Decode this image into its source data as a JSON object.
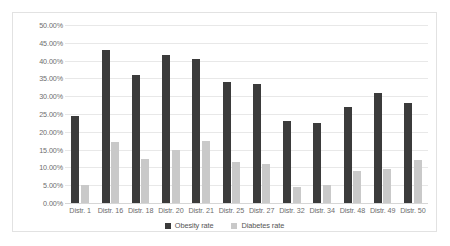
{
  "chart_data": {
    "type": "bar",
    "title": "",
    "xlabel": "",
    "ylabel": "",
    "ylim": [
      0,
      50
    ],
    "ytick_step": 5,
    "ytick_labels": [
      "0.00%",
      "5.00%",
      "10.00%",
      "15.00%",
      "20.00%",
      "25.00%",
      "30.00%",
      "35.00%",
      "40.00%",
      "45.00%",
      "50.00%"
    ],
    "grid": true,
    "legend_position": "bottom",
    "categories": [
      "Distr. 1",
      "Distr. 16",
      "Distr. 18",
      "Distr. 20",
      "Distr. 21",
      "Distr. 25",
      "Distr. 27",
      "Distr. 32",
      "Distr. 34",
      "Distr. 48",
      "Distr. 49",
      "Distr. 50"
    ],
    "series": [
      {
        "name": "Obesity rate",
        "color": "#3b3b3b",
        "values": [
          24.5,
          43.0,
          36.0,
          41.5,
          40.5,
          34.0,
          33.5,
          23.0,
          22.5,
          27.0,
          31.0,
          28.0
        ]
      },
      {
        "name": "Diabetes rate",
        "color": "#c9c9c9",
        "values": [
          5.0,
          17.0,
          12.5,
          15.0,
          17.5,
          11.5,
          11.0,
          4.5,
          5.0,
          9.0,
          9.5,
          12.0
        ]
      }
    ]
  }
}
